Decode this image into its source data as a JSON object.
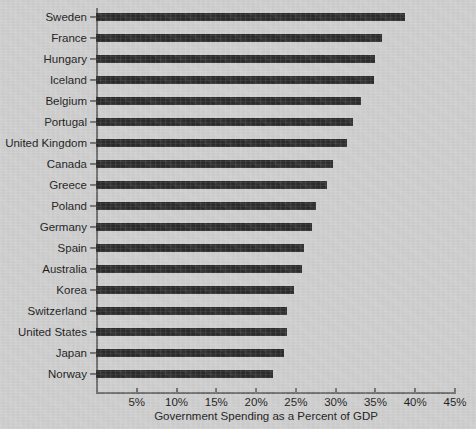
{
  "chart_data": {
    "type": "bar",
    "orientation": "horizontal",
    "title": "",
    "xlabel": "Government Spending as a Percent of GDP",
    "ylabel": "",
    "xlim": [
      0,
      45
    ],
    "xticks": [
      5,
      10,
      15,
      20,
      25,
      30,
      35,
      40,
      45
    ],
    "xtick_labels": [
      "5%",
      "10%",
      "15%",
      "20%",
      "25%",
      "30%",
      "35%",
      "40%",
      "45%"
    ],
    "grid": false,
    "legend": null,
    "bar_color": "#2b2b2b",
    "background_color": "#cdcdcd",
    "axis_color": "#6e6e6e",
    "categories": [
      "Sweden",
      "France",
      "Hungary",
      "Iceland",
      "Belgium",
      "Portugal",
      "United Kingdom",
      "Canada",
      "Greece",
      "Poland",
      "Germany",
      "Spain",
      "Australia",
      "Korea",
      "Switzerland",
      "United States",
      "Japan",
      "Norway"
    ],
    "values": [
      38.8,
      35.9,
      35.1,
      34.9,
      33.3,
      32.3,
      31.5,
      29.8,
      29.0,
      27.6,
      27.1,
      26.1,
      25.9,
      24.9,
      24.0,
      24.0,
      23.6,
      22.3
    ]
  }
}
